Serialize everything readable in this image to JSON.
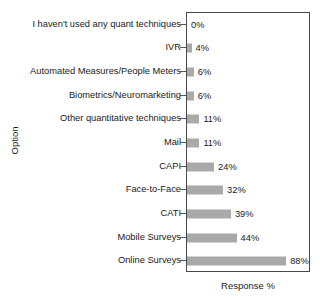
{
  "chart_data": {
    "type": "bar",
    "orientation": "horizontal",
    "title": "",
    "xlabel": "Response %",
    "ylabel": "Option",
    "categories": [
      "I haven't used any quant techniques",
      "IVR",
      "Automated Measures/People Meters",
      "Biometrics/Neuromarketing",
      "Other quantitative techniques",
      "Mail",
      "CAPI",
      "Face-to-Face",
      "CATI",
      "Mobile Surveys",
      "Online Surveys"
    ],
    "values": [
      0,
      4,
      6,
      6,
      11,
      11,
      24,
      32,
      39,
      44,
      88
    ],
    "value_labels": [
      "0%",
      "4%",
      "6%",
      "6%",
      "11%",
      "11%",
      "24%",
      "32%",
      "39%",
      "44%",
      "88%"
    ],
    "xlim": [
      0,
      110
    ],
    "grid": false,
    "legend": null,
    "bar_color": "#a9a9a9",
    "frame_color": "#4a4a4a",
    "text_color": "#1a1a1a"
  }
}
